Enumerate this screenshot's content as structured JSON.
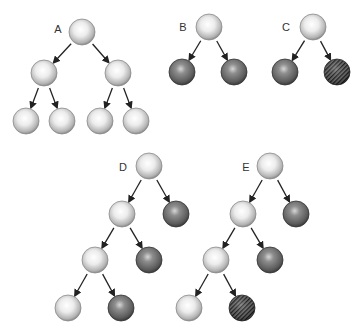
{
  "colors": {
    "background": "#ffffff",
    "light_center": "#ffffff",
    "light_mid": "#e6e6e6",
    "light_edge": "#9a9a9a",
    "dark_center": "#c8c8c8",
    "dark_mid": "#7a7a7a",
    "dark_edge": "#3c3c3c",
    "hatch_bg": "#6e6e6e",
    "hatch_line": "#1e1e1e",
    "arrow": "#222222"
  },
  "radius": 13,
  "trees": [
    {
      "label": "A",
      "label_pos": [
        58,
        33
      ],
      "nodes": [
        {
          "id": "a0",
          "x": 82,
          "y": 32,
          "type": "light"
        },
        {
          "id": "a1",
          "x": 44,
          "y": 73,
          "type": "light"
        },
        {
          "id": "a2",
          "x": 118,
          "y": 73,
          "type": "light"
        },
        {
          "id": "a3",
          "x": 26,
          "y": 121,
          "type": "light"
        },
        {
          "id": "a4",
          "x": 62,
          "y": 121,
          "type": "light"
        },
        {
          "id": "a5",
          "x": 100,
          "y": 121,
          "type": "light"
        },
        {
          "id": "a6",
          "x": 136,
          "y": 121,
          "type": "light"
        }
      ],
      "edges": [
        [
          "a0",
          "a1"
        ],
        [
          "a0",
          "a2"
        ],
        [
          "a1",
          "a3"
        ],
        [
          "a1",
          "a4"
        ],
        [
          "a2",
          "a5"
        ],
        [
          "a2",
          "a6"
        ]
      ]
    },
    {
      "label": "B",
      "label_pos": [
        183,
        31
      ],
      "nodes": [
        {
          "id": "b0",
          "x": 209,
          "y": 27,
          "type": "light"
        },
        {
          "id": "b1",
          "x": 182,
          "y": 72,
          "type": "dark"
        },
        {
          "id": "b2",
          "x": 234,
          "y": 72,
          "type": "dark"
        }
      ],
      "edges": [
        [
          "b0",
          "b1"
        ],
        [
          "b0",
          "b2"
        ]
      ]
    },
    {
      "label": "C",
      "label_pos": [
        286,
        31
      ],
      "nodes": [
        {
          "id": "c0",
          "x": 313,
          "y": 27,
          "type": "light"
        },
        {
          "id": "c1",
          "x": 285,
          "y": 72,
          "type": "dark"
        },
        {
          "id": "c2",
          "x": 337,
          "y": 72,
          "type": "hatched"
        }
      ],
      "edges": [
        [
          "c0",
          "c1"
        ],
        [
          "c0",
          "c2"
        ]
      ]
    },
    {
      "label": "D",
      "label_pos": [
        123,
        171
      ],
      "nodes": [
        {
          "id": "d0",
          "x": 149,
          "y": 166,
          "type": "light"
        },
        {
          "id": "d1",
          "x": 122,
          "y": 214,
          "type": "light"
        },
        {
          "id": "d2",
          "x": 176,
          "y": 214,
          "type": "dark"
        },
        {
          "id": "d3",
          "x": 95,
          "y": 260,
          "type": "light"
        },
        {
          "id": "d4",
          "x": 149,
          "y": 260,
          "type": "dark"
        },
        {
          "id": "d5",
          "x": 68,
          "y": 308,
          "type": "light"
        },
        {
          "id": "d6",
          "x": 121,
          "y": 308,
          "type": "dark"
        }
      ],
      "edges": [
        [
          "d0",
          "d1"
        ],
        [
          "d0",
          "d2"
        ],
        [
          "d1",
          "d3"
        ],
        [
          "d1",
          "d4"
        ],
        [
          "d3",
          "d5"
        ],
        [
          "d3",
          "d6"
        ]
      ]
    },
    {
      "label": "E",
      "label_pos": [
        246,
        171
      ],
      "nodes": [
        {
          "id": "e0",
          "x": 270,
          "y": 166,
          "type": "light"
        },
        {
          "id": "e1",
          "x": 243,
          "y": 214,
          "type": "light"
        },
        {
          "id": "e2",
          "x": 296,
          "y": 214,
          "type": "dark"
        },
        {
          "id": "e3",
          "x": 216,
          "y": 260,
          "type": "light"
        },
        {
          "id": "e4",
          "x": 270,
          "y": 260,
          "type": "dark"
        },
        {
          "id": "e5",
          "x": 189,
          "y": 308,
          "type": "light"
        },
        {
          "id": "e6",
          "x": 242,
          "y": 308,
          "type": "hatched"
        }
      ],
      "edges": [
        [
          "e0",
          "e1"
        ],
        [
          "e0",
          "e2"
        ],
        [
          "e1",
          "e3"
        ],
        [
          "e1",
          "e4"
        ],
        [
          "e3",
          "e5"
        ],
        [
          "e3",
          "e6"
        ]
      ]
    }
  ]
}
